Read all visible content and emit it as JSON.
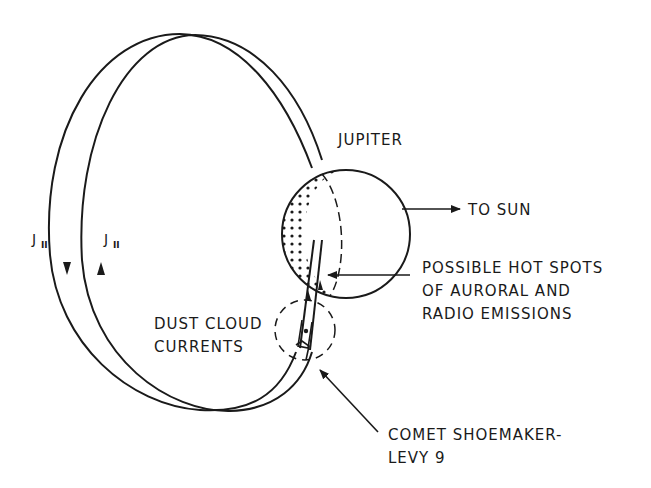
{
  "diagram": {
    "labels": {
      "jupiter": "JUPITER",
      "to_sun": "TO SUN",
      "hot_spots": [
        "POSSIBLE HOT SPOTS",
        "OF AURORAL AND",
        "RADIO EMISSIONS"
      ],
      "dust_cloud": [
        "DUST CLOUD",
        "CURRENTS"
      ],
      "comet": [
        "COMET SHOEMAKER-",
        "LEVY 9"
      ],
      "current_outer": "J",
      "current_outer_sub": "II",
      "current_inner": "J",
      "current_inner_sub": "II"
    },
    "colors": {
      "ink": "#1a1a1a",
      "background": "#ffffff"
    }
  }
}
